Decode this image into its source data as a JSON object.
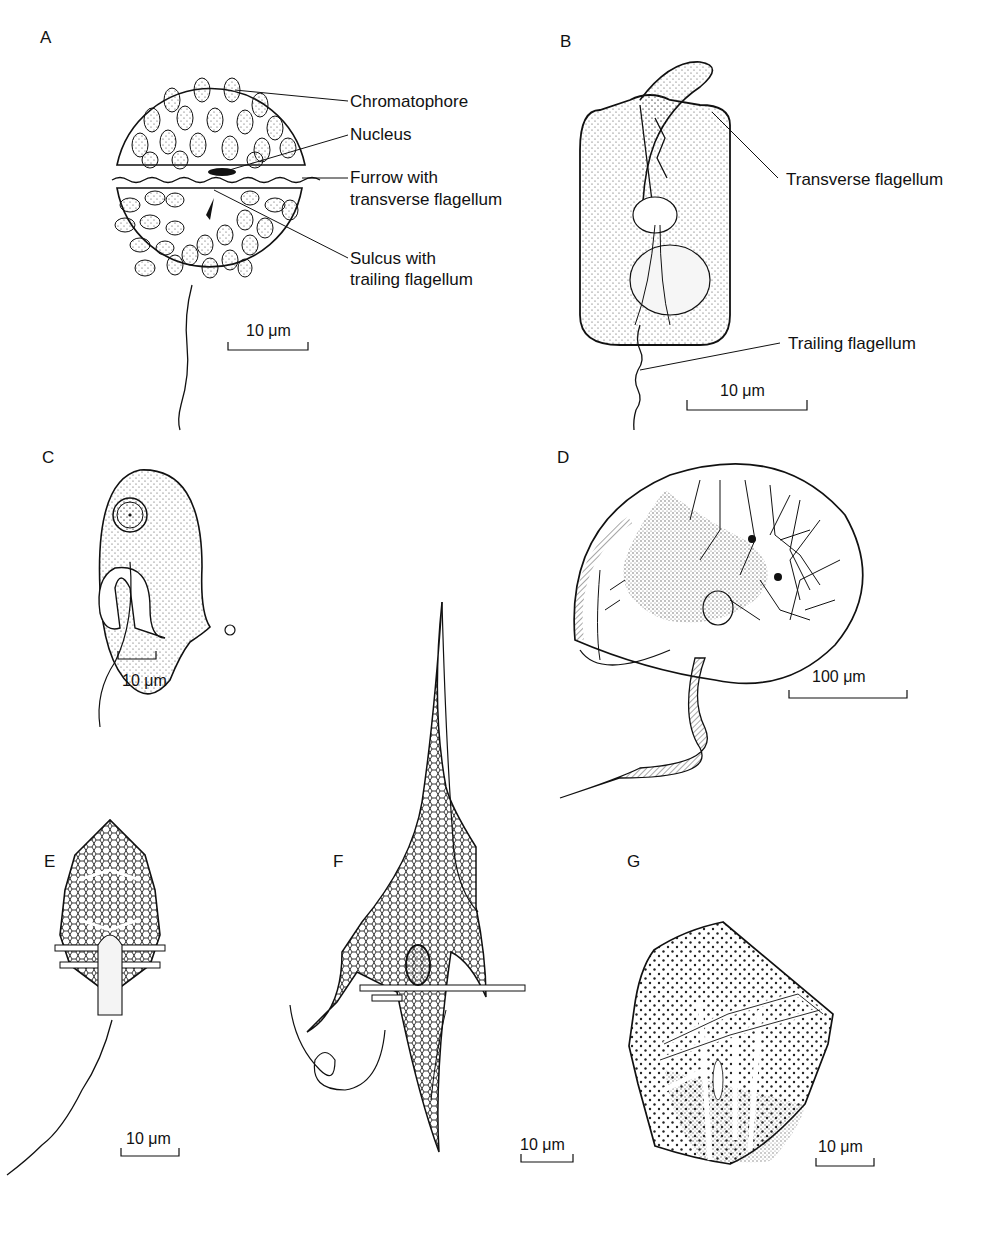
{
  "figure": {
    "panels": [
      {
        "id": "A",
        "letter": "A",
        "callouts": [
          "Chromatophore",
          "Nucleus",
          "Furrow with",
          "transverse flagellum",
          "Sulcus with",
          "trailing flagellum"
        ],
        "scale_bar": "10 μm"
      },
      {
        "id": "B",
        "letter": "B",
        "callouts": [
          "Transverse flagellum",
          "Trailing flagellum"
        ],
        "scale_bar": "10 μm"
      },
      {
        "id": "C",
        "letter": "C",
        "scale_bar": "10 μm"
      },
      {
        "id": "D",
        "letter": "D",
        "scale_bar": "100 μm"
      },
      {
        "id": "E",
        "letter": "E",
        "scale_bar": "10 μm"
      },
      {
        "id": "F",
        "letter": "F",
        "scale_bar": "10 μm"
      },
      {
        "id": "G",
        "letter": "G",
        "scale_bar": "10 μm"
      }
    ]
  },
  "colors": {
    "ink": "#111111",
    "background": "#ffffff",
    "stipple": "#555555"
  }
}
